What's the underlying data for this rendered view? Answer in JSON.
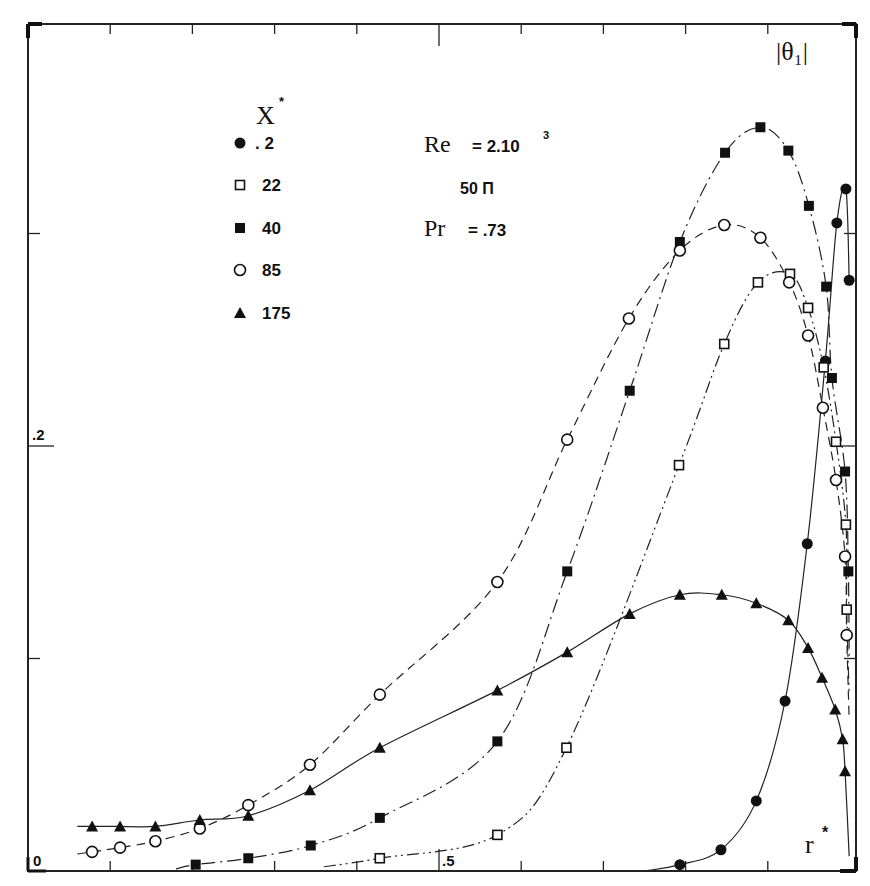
{
  "chart_data": {
    "type": "line",
    "title": "",
    "xlabel": "r*",
    "ylabel": "|θ1|",
    "xlim": [
      0,
      1
    ],
    "ylim": [
      0,
      0.4
    ],
    "x_tick_step": 0.1,
    "y_tick_step": 0.1,
    "x_tick_labels": [
      {
        "value": 0,
        "label": "0"
      },
      {
        "value": 0.5,
        "label": ".5"
      }
    ],
    "y_tick_labels": [
      {
        "value": 0.2,
        "label": ".2"
      }
    ],
    "grid": false,
    "legend": {
      "title": "X*",
      "position": "upper-left",
      "entries": [
        ".2",
        "22",
        "40",
        "85",
        "175"
      ]
    },
    "annotations": [
      {
        "text": "Re = 2.10³",
        "position": "upper-center"
      },
      {
        "text": "50 Π",
        "position": "upper-center"
      },
      {
        "text": "Pr = .73",
        "position": "upper-center"
      }
    ],
    "series": [
      {
        "name": ".2",
        "marker": "filled-circle",
        "line": "solid",
        "x": [
          0.793,
          0.843,
          0.886,
          0.921,
          0.948,
          0.97,
          0.984,
          0.995,
          0.999
        ],
        "y": [
          0.003,
          0.01,
          0.033,
          0.08,
          0.154,
          0.24,
          0.305,
          0.321,
          0.278
        ]
      },
      {
        "name": "22",
        "marker": "open-square",
        "line": "dash-dot-dot",
        "x": [
          0.428,
          0.571,
          0.655,
          0.792,
          0.847,
          0.888,
          0.927,
          0.949,
          0.968,
          0.983,
          0.995,
          0.996
        ],
        "y": [
          0.006,
          0.017,
          0.058,
          0.191,
          0.248,
          0.277,
          0.281,
          0.265,
          0.237,
          0.202,
          0.163,
          0.123
        ]
      },
      {
        "name": "40",
        "marker": "filled-square",
        "line": "dash-dot",
        "x": [
          0.204,
          0.268,
          0.344,
          0.428,
          0.571,
          0.656,
          0.732,
          0.793,
          0.848,
          0.891,
          0.925,
          0.95,
          0.971,
          0.978,
          0.994,
          0.998
        ],
        "y": [
          0.003,
          0.006,
          0.012,
          0.025,
          0.061,
          0.141,
          0.226,
          0.296,
          0.338,
          0.35,
          0.339,
          0.313,
          0.275,
          0.232,
          0.188,
          0.141
        ]
      },
      {
        "name": "85",
        "marker": "open-circle",
        "line": "dashed",
        "x": [
          0.078,
          0.112,
          0.155,
          0.209,
          0.268,
          0.343,
          0.428,
          0.571,
          0.656,
          0.731,
          0.793,
          0.847,
          0.891,
          0.926,
          0.949,
          0.967,
          0.983,
          0.994,
          0.996
        ],
        "y": [
          0.009,
          0.011,
          0.014,
          0.02,
          0.031,
          0.05,
          0.083,
          0.136,
          0.203,
          0.26,
          0.292,
          0.304,
          0.298,
          0.277,
          0.252,
          0.218,
          0.184,
          0.148,
          0.111
        ]
      },
      {
        "name": "175",
        "marker": "filled-triangle",
        "line": "solid",
        "x": [
          0.078,
          0.112,
          0.155,
          0.209,
          0.268,
          0.343,
          0.428,
          0.571,
          0.656,
          0.732,
          0.793,
          0.844,
          0.886,
          0.925,
          0.949,
          0.966,
          0.982,
          0.991,
          0.994
        ],
        "y": [
          0.021,
          0.021,
          0.021,
          0.024,
          0.026,
          0.038,
          0.058,
          0.085,
          0.103,
          0.121,
          0.13,
          0.13,
          0.126,
          0.118,
          0.105,
          0.091,
          0.076,
          0.062,
          0.047
        ]
      }
    ]
  },
  "labels": {
    "y_axis": "|θ₁|",
    "x_axis": "r",
    "x_axis_sup": "*",
    "legend_title": "X",
    "legend_title_sup": "*",
    "re_label": "Re",
    "re_value": "= 2.10",
    "re_exp": "3",
    "grid_label": "50 Π",
    "pr_label": "Pr",
    "pr_value": "= .73",
    "tick_x0": "0",
    "tick_x05": ".5",
    "tick_y02": ".2"
  },
  "legend": [
    {
      "marker": "filled-circle",
      "label": ". 2"
    },
    {
      "marker": "open-square",
      "label": "22"
    },
    {
      "marker": "filled-square",
      "label": "40"
    },
    {
      "marker": "open-circle",
      "label": "85"
    },
    {
      "marker": "filled-triangle",
      "label": "175"
    }
  ]
}
